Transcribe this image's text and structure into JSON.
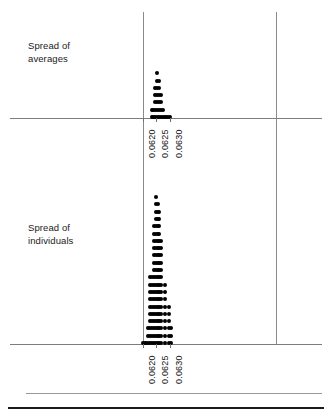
{
  "figure": {
    "title": "",
    "background_color": "#ffffff",
    "axis_color": "#7d7d7d",
    "dot_color": "#000000",
    "rule_color": "#1a1a1a"
  },
  "panels": [
    {
      "name": "spread-of-averages",
      "label": "Spread of\naverages",
      "tick_labels": [
        "0.0620",
        "0.0625",
        "0.0630"
      ]
    },
    {
      "name": "spread-of-individuals",
      "label": "Spread of\nindividuals",
      "tick_labels": [
        "0.0620",
        "0.0625",
        "0.0630"
      ]
    }
  ],
  "chart_data": [
    {
      "type": "dotplot",
      "name": "Spread of averages",
      "title": "Spread of averages",
      "xlabel": "",
      "ylabel": "",
      "xlim": [
        0.06175,
        0.0633
      ],
      "xticks": [
        0.062,
        0.0625,
        0.063
      ],
      "xtick_labels": [
        "0.0620",
        "0.0625",
        "0.0630"
      ],
      "grid": false,
      "legend": "none",
      "orientation": "vertical-stacks",
      "x": [
        0.06232,
        0.06239,
        0.06246,
        0.06253,
        0.0626,
        0.06267,
        0.06274,
        0.06281,
        0.06288,
        0.06295,
        0.06302
      ],
      "counts": [
        2,
        2,
        5,
        7,
        6,
        4,
        2,
        1,
        1,
        1,
        1
      ],
      "values": [
        2,
        2,
        5,
        7,
        6,
        4,
        2,
        1,
        1,
        1,
        1
      ],
      "categories": [
        "0.06232",
        "0.06239",
        "0.06246",
        "0.06253",
        "0.06260",
        "0.06267",
        "0.06274",
        "0.06281",
        "0.06288",
        "0.06295",
        "0.06302"
      ],
      "total_points": 32
    },
    {
      "type": "dotplot",
      "name": "Spread of individuals",
      "title": "Spread of individuals",
      "xlabel": "",
      "ylabel": "",
      "xlim": [
        0.06175,
        0.0633
      ],
      "xticks": [
        0.062,
        0.0625,
        0.063
      ],
      "xtick_labels": [
        "0.0620",
        "0.0625",
        "0.0630"
      ],
      "grid": false,
      "legend": "none",
      "orientation": "vertical-stacks",
      "x": [
        0.06199,
        0.06206,
        0.06213,
        0.0622,
        0.06227,
        0.06234,
        0.06241,
        0.06248,
        0.06255,
        0.06262,
        0.06269,
        0.06276,
        0.06283,
        0.0629,
        0.06297,
        0.06304
      ],
      "counts": [
        1,
        1,
        1,
        3,
        10,
        10,
        17,
        21,
        20,
        19,
        15,
        0,
        9,
        0,
        6,
        3
      ],
      "values": [
        1,
        1,
        1,
        3,
        10,
        10,
        17,
        21,
        20,
        19,
        15,
        0,
        9,
        0,
        6,
        3
      ],
      "categories": [
        "0.06199",
        "0.06206",
        "0.06213",
        "0.06220",
        "0.06227",
        "0.06234",
        "0.06241",
        "0.06248",
        "0.06255",
        "0.06262",
        "0.06269",
        "0.06276",
        "0.06283",
        "0.06290",
        "0.06297",
        "0.06304"
      ],
      "total_points": 136
    }
  ],
  "geometry": {
    "top_axis_y": 118,
    "bottom_axis_y": 344,
    "vline_left_x": 143,
    "vline_right_x": 276,
    "dot_pitch_x": 9.2,
    "dot_pitch_y": 7.3,
    "x_origin": 143,
    "x_scale_per_unit": 26600
  }
}
